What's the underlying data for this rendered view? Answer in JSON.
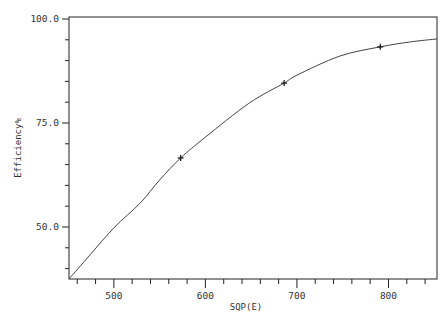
{
  "chart_data": {
    "type": "line",
    "title": "",
    "xlabel": "SQP(E)",
    "ylabel": "Efficiency%",
    "xlim": [
      451,
      853
    ],
    "ylim": [
      37.5,
      100.0
    ],
    "x_ticks": [
      500,
      600,
      700,
      800
    ],
    "x_tick_labels": [
      "500",
      "600",
      "700",
      "800"
    ],
    "y_ticks": [
      50.0,
      75.0,
      100.0
    ],
    "y_tick_labels": [
      "50.0",
      "75.0",
      "100.0"
    ],
    "x_minor_step": 20,
    "y_minor_step": 5,
    "grid": false,
    "legend": null,
    "series": [
      {
        "name": "Efficiency curve",
        "style": "line",
        "x": [
          451,
          474,
          500,
          529,
          550,
          573,
          600,
          648,
          686,
          700,
          747,
          791,
          824,
          853
        ],
        "y": [
          37.5,
          43.3,
          49.8,
          55.8,
          61.3,
          66.6,
          71.6,
          79.8,
          84.6,
          86.5,
          91.1,
          93.3,
          94.5,
          95.2
        ]
      },
      {
        "name": "Measured points",
        "style": "marker-plus",
        "x": [
          573,
          686,
          791
        ],
        "y": [
          66.6,
          84.6,
          93.3
        ]
      }
    ]
  },
  "colors": {
    "background": "#ffffff",
    "line": "#333333",
    "axis": "#222222"
  }
}
